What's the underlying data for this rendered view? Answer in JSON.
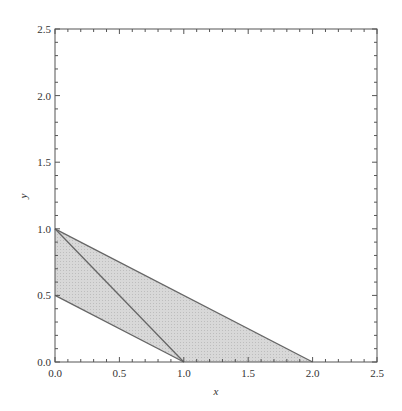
{
  "chart_data": {
    "type": "area",
    "title": "",
    "xlabel": "x",
    "ylabel": "y",
    "xlim": [
      0,
      2.5
    ],
    "ylim": [
      0,
      2.5
    ],
    "xticks": [
      "0.0",
      "0.5",
      "1.0",
      "1.5",
      "2.0",
      "2.5"
    ],
    "yticks": [
      "0.0",
      "0.5",
      "1.0",
      "1.5",
      "2.0",
      "2.5"
    ],
    "grid": false,
    "legend": null,
    "shaded_region": {
      "description": "Parallelogram region bounded by x+2y=1 (lower) and x+2y=2 (upper), x>=0, y>=0",
      "vertices": [
        [
          0,
          0.5
        ],
        [
          0,
          1.0
        ],
        [
          2.0,
          0
        ],
        [
          1.0,
          0
        ]
      ],
      "fill": "#d4d4d4"
    },
    "lines": [
      {
        "name": "upper boundary",
        "points": [
          [
            0,
            1.0
          ],
          [
            2.0,
            0
          ]
        ]
      },
      {
        "name": "lower boundary",
        "points": [
          [
            0,
            0.5
          ],
          [
            1.0,
            0
          ]
        ]
      },
      {
        "name": "diagonal",
        "points": [
          [
            0,
            1.0
          ],
          [
            1.0,
            0
          ]
        ]
      }
    ]
  },
  "labels": {
    "x_axis": "x",
    "y_axis": "y"
  }
}
